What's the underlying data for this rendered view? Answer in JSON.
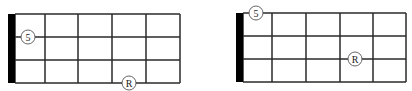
{
  "diagrams": [
    {
      "name": "left-fretboard",
      "nut": {
        "x": 8,
        "y": 14,
        "w": 7,
        "h": 69
      },
      "strings_y": [
        14,
        37,
        60,
        83
      ],
      "frets_x": [
        15,
        45,
        78,
        112,
        146,
        180
      ],
      "markers": [
        {
          "label": "5",
          "cx": 28,
          "cy": 37
        },
        {
          "label": "R",
          "cx": 129,
          "cy": 83
        }
      ]
    },
    {
      "name": "right-fretboard",
      "nut": {
        "x": 236,
        "y": 13,
        "w": 7,
        "h": 69
      },
      "strings_y": [
        13,
        36,
        59,
        82
      ],
      "frets_x": [
        243,
        272,
        306,
        340,
        373,
        406
      ],
      "markers": [
        {
          "label": "5",
          "cx": 256,
          "cy": 13
        },
        {
          "label": "R",
          "cx": 355,
          "cy": 59
        }
      ]
    }
  ],
  "colors": {
    "line": "#2a2a2a",
    "nut": "#000000",
    "marker_fill": "#ffffff",
    "marker_stroke": "#555555"
  }
}
